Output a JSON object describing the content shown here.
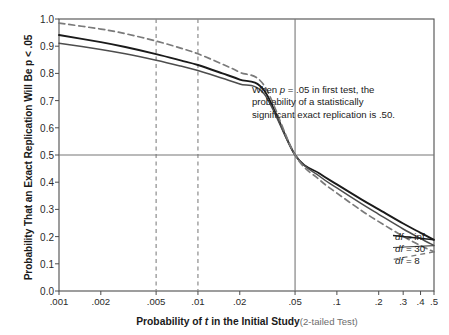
{
  "chart_data": {
    "type": "line",
    "title": "",
    "xlabel": "Probability of t in the Initial Study (2-tailed Test)",
    "xlabel_main": "Probability of ",
    "xlabel_ital": "t",
    "xlabel_main2": " in the Initial Study",
    "xlabel_sub": "(2-tailed Test)",
    "ylabel": "Probability That an Exact Replication Will Be p < .05",
    "xscale": "log",
    "xlim": [
      0.001,
      0.5
    ],
    "ylim": [
      0.0,
      1.0
    ],
    "grid": false,
    "legend_position": "inline-right",
    "xticks": [
      {
        "value": 0.001,
        "label": ".001"
      },
      {
        "value": 0.002,
        "label": ".002"
      },
      {
        "value": 0.005,
        "label": ".005"
      },
      {
        "value": 0.01,
        "label": ".01"
      },
      {
        "value": 0.02,
        "label": ".02"
      },
      {
        "value": 0.05,
        "label": ".05"
      },
      {
        "value": 0.1,
        "label": ".1"
      },
      {
        "value": 0.2,
        "label": ".2"
      },
      {
        "value": 0.3,
        "label": ".3"
      },
      {
        "value": 0.4,
        "label": ".4"
      },
      {
        "value": 0.5,
        "label": ".5"
      }
    ],
    "yticks": [
      {
        "value": 1.0,
        "label": "1.0"
      },
      {
        "value": 0.9,
        "label": "0.9"
      },
      {
        "value": 0.8,
        "label": "0.8"
      },
      {
        "value": 0.7,
        "label": "0.7"
      },
      {
        "value": 0.6,
        "label": "0.6"
      },
      {
        "value": 0.5,
        "label": "0.5"
      },
      {
        "value": 0.4,
        "label": "0.4"
      },
      {
        "value": 0.3,
        "label": "0.3"
      },
      {
        "value": 0.2,
        "label": "0.2"
      },
      {
        "value": 0.1,
        "label": "0.1"
      },
      {
        "value": 0.0,
        "label": "0.0"
      }
    ],
    "reference_lines": [
      {
        "name": "vline-p005",
        "axis": "x",
        "value": 0.005,
        "style": "dashed",
        "color": "#8c8c8c"
      },
      {
        "name": "vline-p01",
        "axis": "x",
        "value": 0.01,
        "style": "dashed",
        "color": "#8c8c8c"
      },
      {
        "name": "vline-p05",
        "axis": "x",
        "value": 0.05,
        "style": "solid",
        "color": "#777777"
      },
      {
        "name": "hline-050",
        "axis": "y",
        "value": 0.5,
        "style": "solid",
        "color": "#777777"
      }
    ],
    "series": [
      {
        "name": "df = inf",
        "label_main": "df",
        "label_rest": " = inf",
        "style": "solid",
        "color": "#1a1a1a",
        "width": 1.9,
        "x": [
          0.001,
          0.002,
          0.003,
          0.005,
          0.0075,
          0.01,
          0.015,
          0.02,
          0.03,
          0.05,
          0.075,
          0.1,
          0.15,
          0.2,
          0.3,
          0.4,
          0.5
        ],
        "y": [
          0.941,
          0.915,
          0.897,
          0.871,
          0.848,
          0.831,
          0.8,
          0.777,
          0.737,
          0.5,
          0.432,
          0.392,
          0.337,
          0.3,
          0.248,
          0.214,
          0.188
        ]
      },
      {
        "name": "df = 30",
        "label_main": "df",
        "label_rest": " = 30",
        "style": "solid",
        "color": "#4d4d4d",
        "width": 1.5,
        "x": [
          0.001,
          0.002,
          0.003,
          0.005,
          0.0075,
          0.01,
          0.015,
          0.02,
          0.03,
          0.05,
          0.075,
          0.1,
          0.15,
          0.2,
          0.3,
          0.4,
          0.5
        ],
        "y": [
          0.911,
          0.888,
          0.872,
          0.848,
          0.827,
          0.811,
          0.782,
          0.761,
          0.724,
          0.5,
          0.422,
          0.379,
          0.321,
          0.282,
          0.228,
          0.193,
          0.167
        ]
      },
      {
        "name": "df = 8",
        "label_main": "df",
        "label_rest": " = 8",
        "style": "dashed",
        "color": "#7a7a7a",
        "width": 1.7,
        "x": [
          0.001,
          0.002,
          0.003,
          0.005,
          0.0075,
          0.01,
          0.015,
          0.02,
          0.03,
          0.05,
          0.075,
          0.1,
          0.15,
          0.2,
          0.3,
          0.4,
          0.5
        ],
        "y": [
          0.985,
          0.963,
          0.946,
          0.919,
          0.893,
          0.872,
          0.834,
          0.804,
          0.755,
          0.5,
          0.409,
          0.36,
          0.296,
          0.255,
          0.201,
          0.167,
          0.144
        ]
      }
    ],
    "annotation": {
      "name": "annotation-p05",
      "text": "When p = .05 in first test, the probability of a statistically significant exact replication is .50.",
      "part1": "When ",
      "ital": "p",
      "part2": " = .05 in first test, the probability of a statistically significant exact replication is .50."
    }
  },
  "axes": {
    "y_title": "Probability That an Exact Replication Will Be p < .05"
  }
}
